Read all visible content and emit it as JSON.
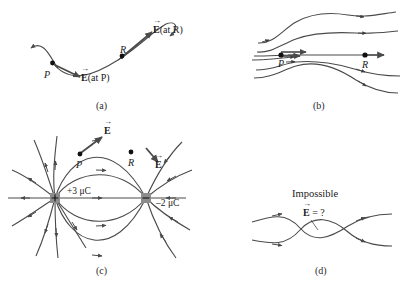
{
  "figure": {
    "background": "#ffffff",
    "line_color": "#4a4a4a",
    "text_color": "#1a1a1a",
    "charge_marker_color": "#8c8c8c"
  },
  "panels": [
    {
      "id": "a",
      "label": "(a)",
      "points": [
        {
          "name": "P",
          "label": "P"
        },
        {
          "name": "R",
          "label": "R"
        }
      ],
      "vectors": [
        {
          "name": "E-at-P",
          "symbol": "E",
          "suffix": "(at P)"
        },
        {
          "name": "E-at-R",
          "symbol": "E",
          "suffix": "(at R)"
        }
      ]
    },
    {
      "id": "b",
      "label": "(b)",
      "points": [
        {
          "name": "P",
          "label": "P"
        },
        {
          "name": "R",
          "label": "R"
        }
      ],
      "vectors": []
    },
    {
      "id": "c",
      "label": "(c)",
      "points": [
        {
          "name": "P",
          "label": "P"
        },
        {
          "name": "R",
          "label": "R"
        }
      ],
      "charges": [
        {
          "name": "positive-charge",
          "label": "+3 μC",
          "sign": "+"
        },
        {
          "name": "negative-charge",
          "label": "–2 μC",
          "sign": "–"
        }
      ],
      "vectors": [
        {
          "name": "E-at-P",
          "symbol": "E",
          "suffix": ""
        },
        {
          "name": "E-at-R",
          "symbol": "E",
          "suffix": ""
        }
      ]
    },
    {
      "id": "d",
      "label": "(d)",
      "title": "Impossible",
      "vectors": [
        {
          "name": "E-unknown",
          "symbol": "E",
          "suffix": "= ?"
        }
      ]
    }
  ]
}
